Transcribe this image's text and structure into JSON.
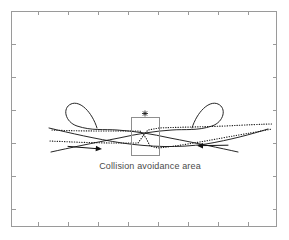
{
  "figure": {
    "canvas": {
      "width": 289,
      "height": 240,
      "background": "#ffffff"
    },
    "caption": {
      "text": "Collision avoidance area",
      "x": 150,
      "y": 169,
      "color": "#4a4a4a",
      "font_size_px": 9
    },
    "plot_frame": {
      "left": 11,
      "top": 11,
      "right": 277,
      "bottom": 226,
      "stroke": "#9a9a9a"
    },
    "ticks": {
      "bottom_x": [
        38,
        68,
        98,
        128,
        158,
        188,
        218,
        248
      ],
      "top_x": [
        38,
        68,
        98,
        128,
        158,
        188,
        218,
        248
      ],
      "left_y": [
        44,
        77,
        110,
        143,
        176,
        209
      ],
      "right_y": [
        44,
        77,
        110,
        143,
        176,
        209
      ],
      "length_px": 4,
      "color": "#9a9a9a"
    },
    "avoidance_box": {
      "label": "Collision avoidance area",
      "x": 131,
      "y": 117,
      "width": 28,
      "height": 38,
      "stroke": "#8e8e8e"
    },
    "conflict_marker": {
      "symbol": "*",
      "name": "asterisk",
      "x": 145,
      "y": 114,
      "color": "#1a1a1a"
    },
    "vessels": [
      {
        "id": "vessel-left",
        "direction": "eastbound",
        "has_loop": true,
        "loop_center_x": 82,
        "loop_center_y": 113,
        "arrow": {
          "from_x": 68,
          "to_x": 100,
          "y": 147,
          "points": "right"
        }
      },
      {
        "id": "vessel-right",
        "direction": "westbound",
        "has_loop": true,
        "loop_center_x": 208,
        "loop_center_y": 113,
        "arrow": {
          "from_x": 228,
          "to_x": 196,
          "y": 147,
          "points": "left"
        }
      }
    ],
    "paths": {
      "solid_label": "vessel track",
      "dotted_label": "planned trajectory",
      "stroke_color": "#1a1a1a"
    },
    "colors": {
      "background": "#ffffff",
      "frame": "#9a9a9a",
      "track": "#1a1a1a",
      "box": "#8e8e8e",
      "caption": "#4a4a4a"
    }
  }
}
